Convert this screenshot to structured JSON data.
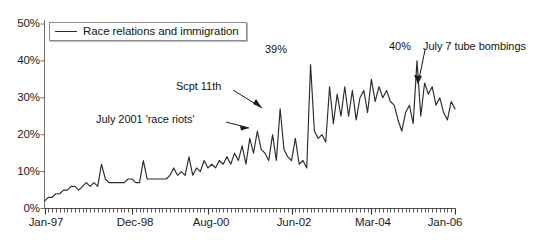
{
  "chart_data": {
    "type": "line",
    "title": "",
    "xlabel": "",
    "ylabel": "",
    "ylim": [
      0,
      50
    ],
    "ytick_labels": [
      "0%",
      "10%",
      "20%",
      "30%",
      "40%",
      "50%"
    ],
    "ytick_values": [
      0,
      10,
      20,
      30,
      40,
      50
    ],
    "xtick_labels": [
      "Jan-97",
      "Dec-98",
      "Aug-00",
      "Jun-02",
      "Mar-04",
      "Jan-06"
    ],
    "xtick_indices": [
      0,
      23,
      43,
      65,
      86,
      108
    ],
    "grid": false,
    "legend_position": "top-left",
    "x_start": "Jan-97",
    "x_end": "Jan-06",
    "x_frequency": "monthly",
    "series": [
      {
        "name": "Race relations and immigration",
        "color": "#2b2b2b",
        "values": [
          2,
          3,
          3,
          4,
          4,
          5,
          5,
          6,
          6,
          5,
          6,
          7,
          6,
          7,
          6,
          12,
          8,
          7,
          7,
          7,
          7,
          7,
          8,
          8,
          7,
          7,
          13,
          8,
          8,
          8,
          8,
          8,
          8,
          9,
          11,
          9,
          10,
          9,
          14,
          9,
          11,
          10,
          13,
          11,
          12,
          11,
          13,
          12,
          14,
          12,
          15,
          13,
          17,
          12,
          19,
          15,
          21,
          16,
          15,
          13,
          20,
          13,
          27,
          16,
          14,
          13,
          19,
          12,
          13,
          11,
          39,
          21,
          19,
          20,
          18,
          33,
          23,
          31,
          25,
          33,
          25,
          32,
          24,
          30,
          32,
          26,
          35,
          29,
          33,
          30,
          32,
          29,
          28,
          24,
          21,
          26,
          28,
          23,
          40,
          25,
          34,
          31,
          33,
          28,
          30,
          26,
          24,
          29,
          27
        ]
      }
    ],
    "annotations": [
      {
        "text": "Scpt 11th",
        "value_note": "peak ~27%"
      },
      {
        "text": "July 2001 'race riots'",
        "value_note": "rise mid-2001"
      },
      {
        "text": "39%",
        "value_note": "peak 39%"
      },
      {
        "text": "40%",
        "value_note": "peak 40%"
      },
      {
        "text": "July 7 tube bombings",
        "value_note": "July 2005"
      }
    ]
  },
  "legend": {
    "label": "Race relations and immigration"
  },
  "axis": {
    "y_labels": [
      "50%",
      "40%",
      "30%",
      "20%",
      "10%",
      "0%"
    ],
    "x_labels": [
      "Jan-97",
      "Dec-98",
      "Aug-00",
      "Jun-02",
      "Mar-04",
      "Jan-06"
    ]
  },
  "annotations": {
    "sept11": "Scpt 11th",
    "race_riots": "July 2001 'race riots'",
    "peak_39": "39%",
    "peak_40": "40%",
    "tube_bombings": "July 7 tube bombings"
  }
}
